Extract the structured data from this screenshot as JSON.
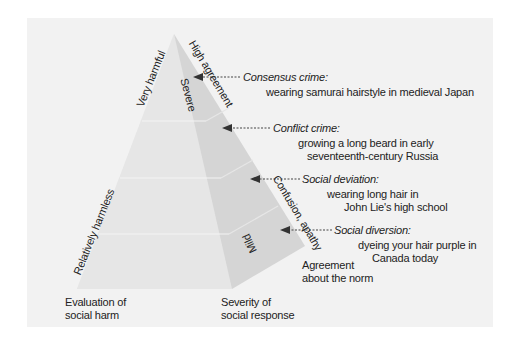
{
  "diagram": {
    "axes": {
      "left_edge": {
        "top_label": "Very harmful",
        "bottom_label": "Relatively harmless"
      },
      "front_right_edge": {
        "top_label": "Severe",
        "bottom_label": "Mild"
      },
      "side_edge": {
        "top_label": "High agreement",
        "middle_label": "Confusion, apathy"
      },
      "bottom_left_caption": [
        "Evaluation of",
        "social harm"
      ],
      "bottom_middle_caption": [
        "Severity of",
        "social response"
      ],
      "bottom_right_caption": [
        "Agreement",
        "about the norm"
      ]
    },
    "levels": [
      {
        "title": "Consensus crime:",
        "example": [
          "wearing samurai hairstyle in medieval Japan"
        ]
      },
      {
        "title": "Conflict crime:",
        "example": [
          "growing a long beard in early",
          "seventeenth-century Russia"
        ]
      },
      {
        "title": "Social deviation:",
        "example": [
          "wearing long hair in",
          "John Lie's high school"
        ]
      },
      {
        "title": "Social diversion:",
        "example": [
          "dyeing your hair purple in",
          "Canada today"
        ]
      }
    ],
    "colors": {
      "background": "#f2f2f2",
      "front_face": "#e6e6e6",
      "side_face": "#d4d4d4",
      "text": "#222222",
      "arrow": "#444444"
    }
  }
}
